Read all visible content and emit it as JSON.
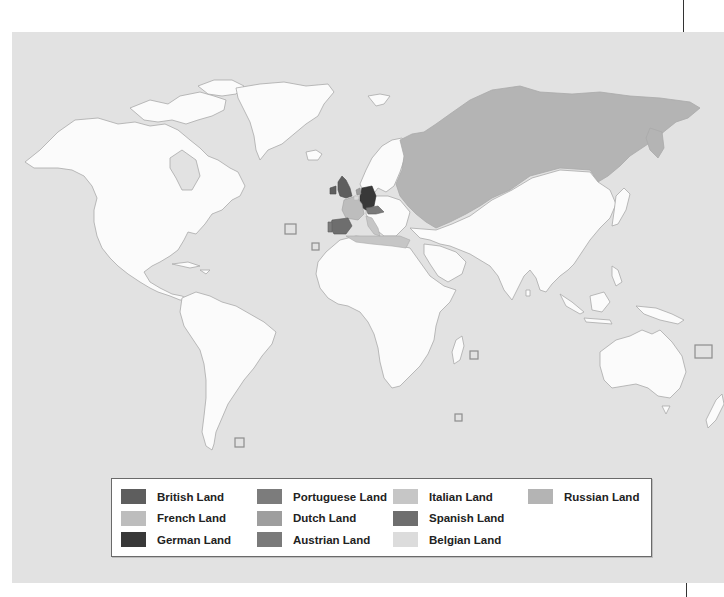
{
  "map": {
    "title": "",
    "ocean_color": "#e2e2e2",
    "unclaimed_land_color": "#fbfbfb",
    "coastline_color": "#a9a9a9"
  },
  "legend": {
    "items": [
      {
        "label": "British Land",
        "color": "#5e5e5e",
        "column": 1,
        "row": 1
      },
      {
        "label": "French Land",
        "color": "#bdbdbd",
        "column": 1,
        "row": 2
      },
      {
        "label": "German Land",
        "color": "#383838",
        "column": 1,
        "row": 3
      },
      {
        "label": "Portuguese Land",
        "color": "#7c7c7c",
        "column": 2,
        "row": 1
      },
      {
        "label": "Dutch Land",
        "color": "#9e9e9e",
        "column": 2,
        "row": 2
      },
      {
        "label": "Austrian Land",
        "color": "#7a7a7a",
        "column": 2,
        "row": 3
      },
      {
        "label": "Italian Land",
        "color": "#c6c6c6",
        "column": 3,
        "row": 1
      },
      {
        "label": "Spanish Land",
        "color": "#6e6e6e",
        "column": 3,
        "row": 2
      },
      {
        "label": "Belgian Land",
        "color": "#dcdcdc",
        "column": 3,
        "row": 3
      },
      {
        "label": "Russian Land",
        "color": "#b4b4b4",
        "column": 4,
        "row": 1
      }
    ]
  },
  "insets": [
    {
      "name": "azores-inset",
      "x": 285,
      "y": 224,
      "w": 11,
      "h": 10
    },
    {
      "name": "madeira-inset",
      "x": 312,
      "y": 243,
      "w": 7,
      "h": 7
    },
    {
      "name": "falklands-inset",
      "x": 235,
      "y": 438,
      "w": 9,
      "h": 9
    },
    {
      "name": "mauritius-inset",
      "x": 470,
      "y": 351,
      "w": 8,
      "h": 8
    },
    {
      "name": "kerguelen-inset",
      "x": 455,
      "y": 414,
      "w": 7,
      "h": 7
    },
    {
      "name": "new-caledonia-inset",
      "x": 695,
      "y": 345,
      "w": 17,
      "h": 13
    }
  ]
}
